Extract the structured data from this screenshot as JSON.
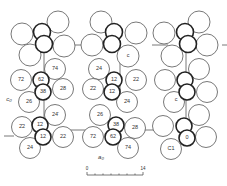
{
  "figure": {
    "axis_labels": {
      "c_axis": "c₀",
      "a_axis": "a₀"
    },
    "atom_heights_left_upper": [
      "74",
      "72",
      "62",
      "38",
      "28",
      "26"
    ],
    "atom_heights_left_lower": [
      "24̄",
      "2̄2",
      "1̄2",
      "12",
      "22",
      "24"
    ],
    "atom_heights_middle_upper": [
      "24",
      "12",
      "22",
      "2̄2",
      "1̄2",
      "2̄4"
    ],
    "atom_heights_middle_lower": [
      "26",
      "38",
      "28",
      "72",
      "62",
      "74"
    ],
    "other_labels": {
      "top_middle_atom": "c",
      "right_atom_a": "c",
      "right_atom_b": "0",
      "right_atom_c": "C1"
    },
    "scale_bar": {
      "start": "0",
      "end": "14",
      "ticks": 7
    }
  }
}
